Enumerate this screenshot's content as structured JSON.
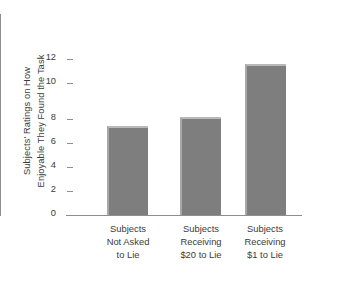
{
  "chart_data": {
    "type": "bar",
    "title": "",
    "xlabel": "",
    "ylabel": "Subjects' Ratings on How Enjoyable They Found the Task",
    "ylabel_lines": [
      "Subjects' Ratings on How",
      "Enjoyable They Found the Task"
    ],
    "categories": [
      "Subjects Not Asked to Lie",
      "Subjects Receiving $20 to Lie",
      "Subjects Receiving $1 to Lie"
    ],
    "category_lines": [
      [
        "Subjects",
        "Not Asked",
        "to Lie"
      ],
      [
        "Subjects",
        "Receiving",
        "$20 to Lie"
      ],
      [
        "Subjects",
        "Receiving",
        "$1 to Lie"
      ]
    ],
    "values": [
      7.4,
      8.2,
      12.6
    ],
    "ylim": [
      0,
      14
    ],
    "yticks": [
      0,
      2,
      4,
      6,
      8,
      10,
      12
    ],
    "ytick_labels": [
      "0",
      "2",
      "4",
      "6",
      "8",
      "10",
      "12"
    ],
    "grid": false,
    "legend": false,
    "bar_color": "#7e7e7e",
    "bar_highlight_color": "#b9b9b9",
    "axis_color": "#8e8e8e",
    "text_color": "#3b3b3b",
    "background_color": "#ffffff"
  }
}
